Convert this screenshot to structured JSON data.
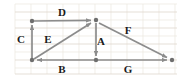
{
  "figure": {
    "canvas": {
      "width": 190,
      "height": 78
    },
    "colors": {
      "background": "#ffffff",
      "grid_minor": "#e8e3dc",
      "grid_major": "#ded7cd",
      "vector": "#8c8c8c",
      "node": "#6e6e6e",
      "label_text": "#1a1a1a"
    },
    "grid": {
      "visible": true,
      "x_start": 15,
      "x_end": 177,
      "y_start": 4,
      "y_end": 74,
      "spacing": 16
    },
    "nodes": [
      {
        "id": "top-left",
        "name": "node-top-left",
        "x": 32,
        "y": 21
      },
      {
        "id": "apex",
        "name": "node-apex",
        "x": 96,
        "y": 20
      },
      {
        "id": "bottom-left",
        "name": "node-bottom-left",
        "x": 32,
        "y": 60
      },
      {
        "id": "bottom-middle",
        "name": "node-bottom-middle",
        "x": 96,
        "y": 60
      },
      {
        "id": "bottom-right",
        "name": "node-bottom-right",
        "x": 172,
        "y": 60
      }
    ],
    "vectors": [
      {
        "id": "A",
        "label": "A",
        "from": "apex",
        "to": "bottom-middle",
        "x1": 96,
        "y1": 22,
        "x2": 96,
        "y2": 58,
        "label_x": 99,
        "label_y": 41,
        "direction": "down"
      },
      {
        "id": "B",
        "label": "B",
        "from": "bottom-middle",
        "to": "bottom-left",
        "x1": 94,
        "y1": 60,
        "x2": 35,
        "y2": 60,
        "label_x": 62,
        "label_y": 69,
        "direction": "left"
      },
      {
        "id": "C",
        "label": "C",
        "from": "bottom-left",
        "to": "top-left",
        "x1": 32,
        "y1": 58,
        "x2": 32,
        "y2": 24,
        "label_x": 21,
        "label_y": 39,
        "direction": "up"
      },
      {
        "id": "D",
        "label": "D",
        "from": "top-left",
        "to": "apex",
        "x1": 34,
        "y1": 21,
        "x2": 93,
        "y2": 20,
        "label_x": 62,
        "label_y": 12,
        "direction": "right"
      },
      {
        "id": "E",
        "label": "E",
        "from": "bottom-left",
        "to": "apex",
        "x1": 34,
        "y1": 59,
        "x2": 93,
        "y2": 22,
        "label_x": 48,
        "label_y": 39,
        "direction": "up-right"
      },
      {
        "id": "F",
        "label": "F",
        "from": "apex",
        "to": "bottom-right",
        "x1": 99,
        "y1": 22,
        "x2": 169,
        "y2": 58,
        "label_x": 128,
        "label_y": 30,
        "direction": "down-right"
      },
      {
        "id": "G",
        "label": "G",
        "from": "bottom-middle",
        "to": "bottom-right",
        "x1": 98,
        "y1": 60,
        "x2": 169,
        "y2": 60,
        "label_x": 128,
        "label_y": 69,
        "direction": "right"
      }
    ]
  }
}
